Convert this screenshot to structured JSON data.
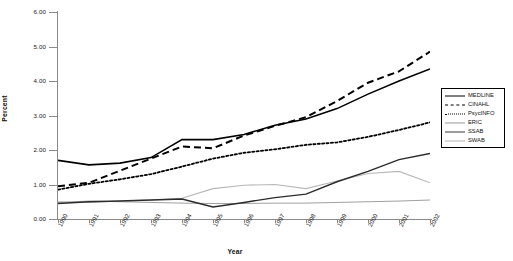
{
  "chart_data": {
    "type": "line",
    "title": "",
    "xlabel": "Year",
    "ylabel": "Percent",
    "ylim": [
      0.0,
      6.0
    ],
    "ytick_labels": [
      "0.00",
      "1.00",
      "2.00",
      "3.00",
      "4.00",
      "5.00",
      "6.00"
    ],
    "ytick_values": [
      0,
      1,
      2,
      3,
      4,
      5,
      6
    ],
    "grid": false,
    "legend_position": "right",
    "categories": [
      "1990",
      "1991",
      "1992",
      "1993",
      "1994",
      "1995",
      "1996",
      "1997",
      "1998",
      "1999",
      "2000",
      "2001",
      "2002"
    ],
    "x": [
      1990,
      1991,
      1992,
      1993,
      1994,
      1995,
      1996,
      1997,
      1998,
      1999,
      2000,
      2001,
      2002
    ],
    "series": [
      {
        "name": "MEDLINE",
        "style": "solid-thick",
        "color": "#000000",
        "values": [
          1.7,
          1.57,
          1.62,
          1.78,
          2.3,
          2.3,
          2.45,
          2.72,
          2.9,
          3.2,
          3.62,
          4.0,
          4.35
        ]
      },
      {
        "name": "CINAHL",
        "style": "dashed",
        "color": "#000000",
        "values": [
          0.95,
          1.05,
          1.4,
          1.75,
          2.1,
          2.05,
          2.42,
          2.7,
          2.95,
          3.42,
          3.95,
          4.28,
          4.85
        ]
      },
      {
        "name": "PsycINFO",
        "style": "dotted",
        "color": "#000000",
        "values": [
          0.85,
          1.02,
          1.15,
          1.3,
          1.52,
          1.75,
          1.92,
          2.02,
          2.15,
          2.22,
          2.38,
          2.58,
          2.8
        ]
      },
      {
        "name": "ERIC",
        "style": "solid-thin",
        "color": "#a0a0a0",
        "values": [
          0.48,
          0.52,
          0.5,
          0.48,
          0.46,
          0.45,
          0.45,
          0.46,
          0.46,
          0.48,
          0.5,
          0.52,
          0.55
        ]
      },
      {
        "name": "SSAB",
        "style": "solid-medium",
        "color": "#2b2b2b",
        "values": [
          0.45,
          0.5,
          0.52,
          0.55,
          0.58,
          0.35,
          0.48,
          0.62,
          0.72,
          1.08,
          1.38,
          1.72,
          1.9
        ]
      },
      {
        "name": "SWAB",
        "style": "solid-light",
        "color": "#b8b8b8",
        "values": [
          0.5,
          0.48,
          0.52,
          0.55,
          0.6,
          0.88,
          0.98,
          1.0,
          0.88,
          1.1,
          1.32,
          1.38,
          1.05
        ]
      }
    ]
  },
  "legend": {
    "items": [
      {
        "label": "MEDLINE"
      },
      {
        "label": "CINAHL"
      },
      {
        "label": "PsycINFO"
      },
      {
        "label": "ERIC"
      },
      {
        "label": "SSAB"
      },
      {
        "label": "SWAB"
      }
    ]
  }
}
